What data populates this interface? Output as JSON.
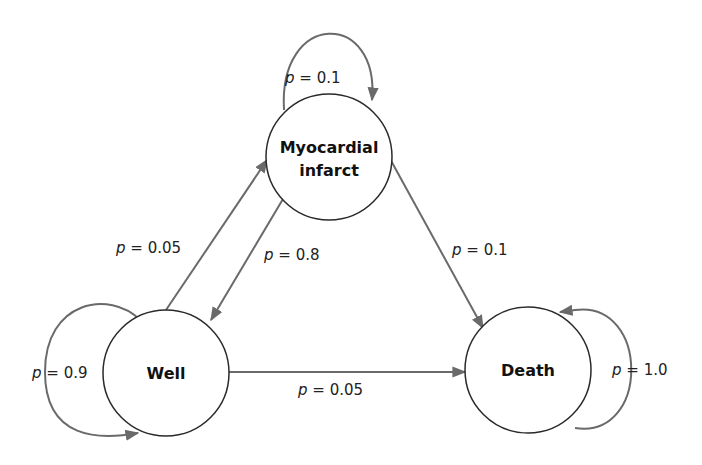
{
  "diagram": {
    "type": "markov-state-transition",
    "nodes": [
      {
        "id": "well",
        "label_lines": [
          "Well"
        ]
      },
      {
        "id": "mi",
        "label_lines": [
          "Myocardial",
          "infarct"
        ]
      },
      {
        "id": "death",
        "label_lines": [
          "Death"
        ]
      }
    ],
    "edges": [
      {
        "from": "well",
        "to": "well",
        "var": "p",
        "eq": " = ",
        "value": "0.9"
      },
      {
        "from": "well",
        "to": "mi",
        "var": "p",
        "eq": " = ",
        "value": "0.05"
      },
      {
        "from": "well",
        "to": "death",
        "var": "p",
        "eq": " = ",
        "value": "0.05"
      },
      {
        "from": "mi",
        "to": "mi",
        "var": "p",
        "eq": " = ",
        "value": "0.1"
      },
      {
        "from": "mi",
        "to": "well",
        "var": "p",
        "eq": " = ",
        "value": "0.8"
      },
      {
        "from": "mi",
        "to": "death",
        "var": "p",
        "eq": " = ",
        "value": "0.1"
      },
      {
        "from": "death",
        "to": "death",
        "var": "p",
        "eq": " = ",
        "value": "1.0"
      }
    ],
    "colors": {
      "edge": "#6a6a6a",
      "node_stroke": "#2a2a2a",
      "text": "#222222"
    }
  }
}
